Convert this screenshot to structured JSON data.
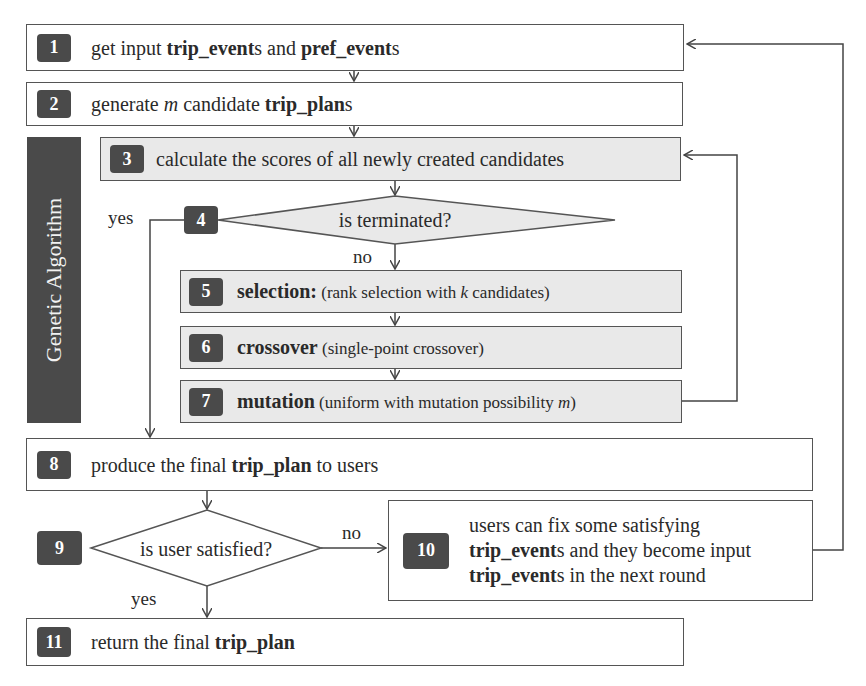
{
  "diagram": {
    "type": "flowchart",
    "sidebar_label": "Genetic Algorithm",
    "steps": [
      {
        "id": 1,
        "badge": "1",
        "parts": [
          "get input ",
          "trip_event",
          "s and ",
          "pref_event",
          "s"
        ]
      },
      {
        "id": 2,
        "badge": "2",
        "parts": [
          "generate ",
          "m",
          " candidate ",
          "trip_plan",
          "s"
        ]
      },
      {
        "id": 3,
        "badge": "3",
        "text": "calculate the scores of all newly created candidates"
      },
      {
        "id": 4,
        "badge": "4",
        "text": "is terminated?",
        "shape": "decision"
      },
      {
        "id": 5,
        "badge": "5",
        "parts": [
          "selection:",
          " (rank selection with ",
          "k",
          " candidates)"
        ]
      },
      {
        "id": 6,
        "badge": "6",
        "parts": [
          "crossover",
          " (single-point crossover)"
        ]
      },
      {
        "id": 7,
        "badge": "7",
        "parts": [
          "mutation",
          " (uniform with mutation possibility ",
          "m",
          ")"
        ]
      },
      {
        "id": 8,
        "badge": "8",
        "parts": [
          "produce the final ",
          "trip_plan",
          " to users"
        ]
      },
      {
        "id": 9,
        "badge": "9",
        "text": "is user satisfied?",
        "shape": "decision"
      },
      {
        "id": 10,
        "badge": "10",
        "lines": [
          [
            "users can fix some satisfying"
          ],
          [
            "trip_event",
            "s and they become input"
          ],
          [
            "trip_event",
            "s in the next round"
          ]
        ]
      },
      {
        "id": 11,
        "badge": "11",
        "parts": [
          "return the final ",
          "trip_plan"
        ]
      }
    ],
    "edge_labels": {
      "step4_yes": "yes",
      "step4_no": "no",
      "step9_no": "no",
      "step9_yes": "yes"
    },
    "colors": {
      "badge_bg": "#4a4a4a",
      "shaded_bg": "#e9e9e9",
      "line": "#555555"
    }
  }
}
